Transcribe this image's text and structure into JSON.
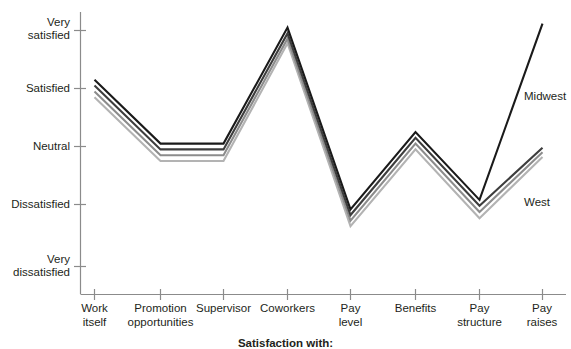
{
  "chart_data": {
    "type": "line",
    "title": "",
    "xlabel": "Satisfaction with:",
    "ylabel": "",
    "grid": false,
    "legend_position": "right-inline",
    "categories": [
      "Work itself",
      "Promotion opportunities",
      "Supervisor",
      "Coworkers",
      "Pay level",
      "Benefits",
      "Pay structure",
      "Pay raises"
    ],
    "ytick_labels": [
      "Very satisfied",
      "Satisfied",
      "Neutral",
      "Dissatisfied",
      "Very dissatisfied"
    ],
    "ytick_values": [
      5,
      4,
      3,
      2,
      1
    ],
    "ylim": [
      1,
      5
    ],
    "series": [
      {
        "name": "Midwest",
        "color": "#1a1a1a",
        "values": [
          4.15,
          3.05,
          3.05,
          5.05,
          1.92,
          3.25,
          2.08,
          5.12
        ]
      },
      {
        "name": "Northeast",
        "color": "#3d3d3d",
        "values": [
          4.05,
          2.95,
          2.95,
          4.95,
          1.83,
          3.15,
          1.98,
          2.98
        ]
      },
      {
        "name": "South",
        "color": "#8c8c8c",
        "values": [
          3.95,
          2.85,
          2.85,
          4.86,
          1.74,
          3.05,
          1.88,
          2.9
        ]
      },
      {
        "name": "West",
        "color": "#b3b3b3",
        "values": [
          3.85,
          2.75,
          2.75,
          4.78,
          1.65,
          2.95,
          1.78,
          2.82
        ]
      }
    ],
    "annotations": [
      {
        "text": "Midwest",
        "x_category": "Pay raises",
        "position": "above-right"
      },
      {
        "text": "West",
        "x_category": "Pay raises",
        "position": "below-right"
      }
    ]
  },
  "axis": {
    "caption": "Satisfaction with:"
  },
  "ylabels": {
    "t0_line1": "Very",
    "t0_line2": "satisfied",
    "t1": "Satisfied",
    "t2": "Neutral",
    "t3": "Dissatisfied",
    "t4_line1": "Very",
    "t4_line2": "dissatisfied"
  },
  "xlabels": {
    "c0_line1": "Work",
    "c0_line2": "itself",
    "c1_line1": "Promotion",
    "c1_line2": "opportunities",
    "c2_line1": "Supervisor",
    "c3_line1": "Coworkers",
    "c4_line1": "Pay",
    "c4_line2": "level",
    "c5_line1": "Benefits",
    "c6_line1": "Pay",
    "c6_line2": "structure",
    "c7_line1": "Pay",
    "c7_line2": "raises"
  },
  "legend": {
    "midwest": "Midwest",
    "west": "West"
  }
}
